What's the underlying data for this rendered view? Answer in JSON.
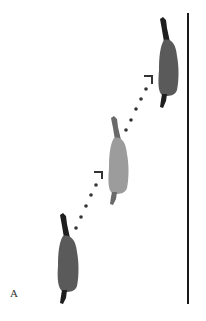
{
  "figure": {
    "panel_label": "A",
    "colors": {
      "background": "#ffffff",
      "wall": "#1a1a1a",
      "horse_dark_body": "#5a5a5a",
      "horse_light_body": "#9c9c9c",
      "horse_head_tail": "#1e1e1e",
      "arrow": "#333333"
    },
    "wall": {
      "x": 188,
      "y1": 13,
      "y2": 304
    },
    "horses": [
      {
        "id": "start",
        "position": "bottom-left",
        "shade": "dark",
        "head": [
          62,
          216
        ],
        "tail_end": [
          63,
          303
        ]
      },
      {
        "id": "middle",
        "position": "center",
        "shade": "light",
        "head": [
          113,
          118
        ],
        "tail_end": [
          112,
          205
        ]
      },
      {
        "id": "end",
        "position": "top-right",
        "shade": "dark",
        "head": [
          162,
          19
        ],
        "tail_end": [
          163,
          108
        ]
      }
    ],
    "arrows": [
      {
        "from": [
          76,
          228
        ],
        "to": [
          100,
          174
        ],
        "style": "dotted",
        "dot_count": 5
      },
      {
        "from": [
          126,
          130
        ],
        "to": [
          150,
          78
        ],
        "style": "dotted",
        "dot_count": 5
      }
    ]
  }
}
